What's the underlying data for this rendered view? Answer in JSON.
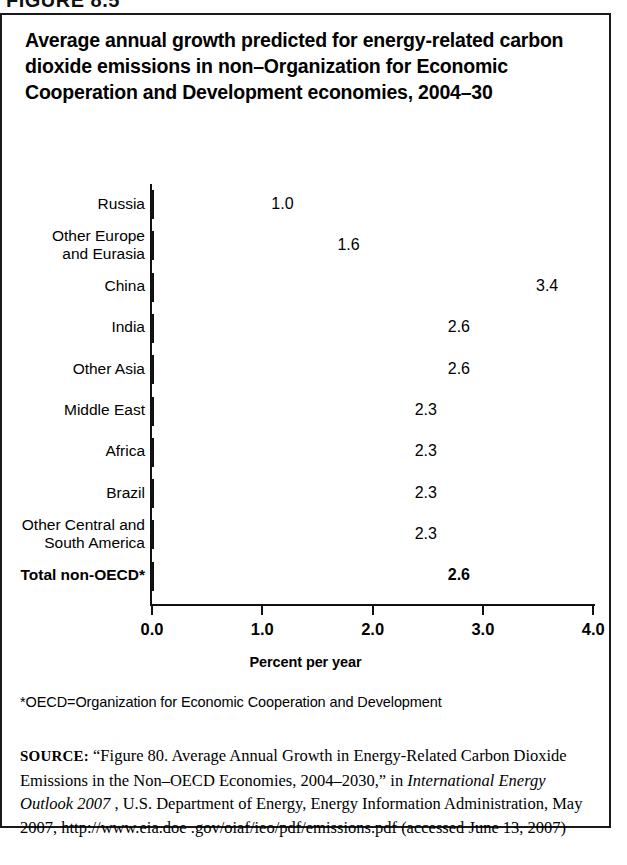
{
  "figure": {
    "number_label": "FIGURE 8.5",
    "title": "Average annual growth predicted for energy-related carbon dioxide emissions in non–Organization for Economic Cooperation and Development economies, 2004–30",
    "footnote": "*OECD=Organization for Economic Cooperation and Development"
  },
  "source": {
    "kicker": "SOURCE:",
    "part1": " “Figure 80. Average Annual Growth in Energy-Related Carbon Dioxide Emissions in the Non–OECD Economies, 2004–2030,” in ",
    "italic": "International Energy Outlook 2007",
    "part2": " , U.S. Department of Energy, Energy Information Administration, May 2007, http://www.eia.doe .gov/oiaf/ieo/pdf/emissions.pdf (accessed June 13, 2007)"
  },
  "chart_data": {
    "type": "bar",
    "orientation": "horizontal",
    "title": "Average annual growth predicted for energy-related carbon dioxide emissions in non–Organization for Economic Cooperation and Development economies, 2004–30",
    "xlabel": "Percent per year",
    "ylabel": "",
    "xlim": [
      0.0,
      4.0
    ],
    "xticks": [
      "0.0",
      "1.0",
      "2.0",
      "3.0",
      "4.0"
    ],
    "xtick_values": [
      0.0,
      1.0,
      2.0,
      3.0,
      4.0
    ],
    "grid": false,
    "legend": null,
    "categories": [
      "Russia",
      "Other Europe\nand Eurasia",
      "China",
      "India",
      "Other Asia",
      "Middle East",
      "Africa",
      "Brazil",
      "Other Central and\nSouth America",
      "Total non-OECD*"
    ],
    "values": [
      1.0,
      1.6,
      3.4,
      2.6,
      2.6,
      2.3,
      2.3,
      2.3,
      2.3,
      2.6
    ],
    "value_labels": [
      "1.0",
      "1.6",
      "3.4",
      "2.6",
      "2.6",
      "2.3",
      "2.3",
      "2.3",
      "2.3",
      "2.6"
    ],
    "emphasized_index": 9,
    "bar_color": "#8a8a8a",
    "bar_border_color": "#111111"
  }
}
